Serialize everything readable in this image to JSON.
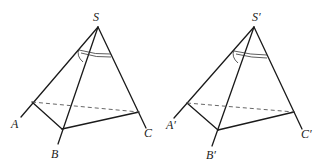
{
  "figures": [
    {
      "name": "pyramid-1",
      "labels": {
        "apex": "S",
        "a": "A",
        "b": "B",
        "c": "C"
      }
    },
    {
      "name": "pyramid-2",
      "labels": {
        "apex": "S′",
        "a": "A′",
        "b": "B′",
        "c": "C′"
      }
    }
  ]
}
